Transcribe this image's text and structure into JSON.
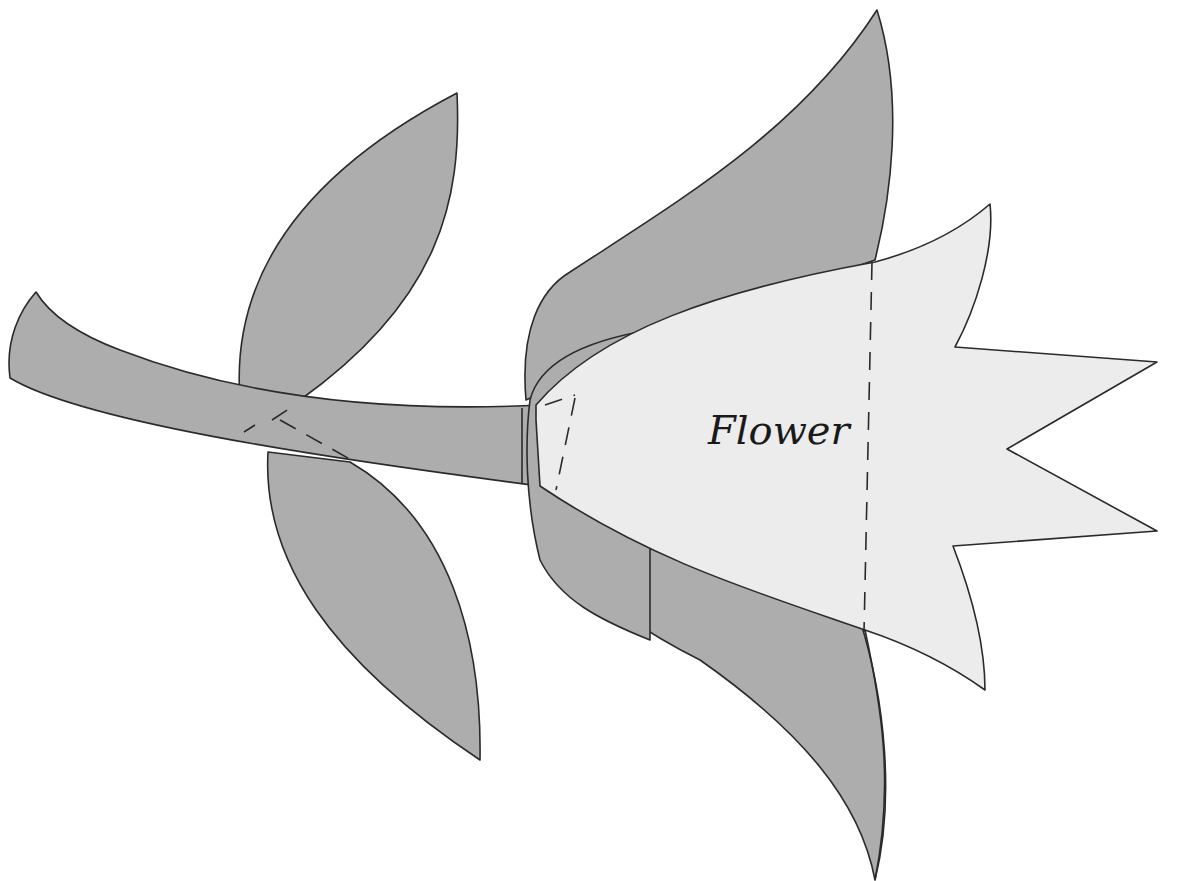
{
  "diagram": {
    "label": "Flower",
    "colors": {
      "dark_fill": "#adadad",
      "light_fill": "#ececec",
      "outline": "#2a2a2a",
      "background": "#ffffff"
    },
    "parts": [
      "stem",
      "upper-leaf",
      "lower-leaf",
      "upper-sepal",
      "lower-sepal",
      "flower-head"
    ],
    "fold_lines": [
      "leaf-joint-dashes",
      "flower-base-dashes",
      "flower-vertical-dashes"
    ]
  }
}
